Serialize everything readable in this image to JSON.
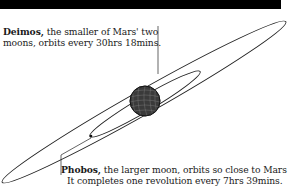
{
  "diagram": {
    "title_bar_color": "#000000",
    "planet": {
      "name": "Mars",
      "icon": "mars-globe-icon"
    },
    "moons": [
      {
        "name": "Deimos",
        "name_suffix": ",",
        "line1_rest": " the smaller of Mars' two",
        "line2": "moons, orbits every 30hrs 18mins.",
        "orbit": "outer"
      },
      {
        "name": "Phobos",
        "name_suffix": ",",
        "line1_rest": " the larger moon, orbits so close to Mars",
        "line2": "It completes one revolution every 7hrs 39mins.",
        "orbit": "inner"
      }
    ]
  }
}
